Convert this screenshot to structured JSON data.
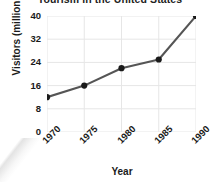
{
  "chart_data": {
    "type": "line",
    "title": "Tourism in the United States",
    "xlabel": "Year",
    "ylabel": "Visitors (millions)",
    "categories": [
      "1970",
      "1975",
      "1980",
      "1985",
      "1990"
    ],
    "x": [
      1970,
      1975,
      1980,
      1985,
      1990
    ],
    "values": [
      12,
      16,
      22,
      25,
      40
    ],
    "series": [
      {
        "name": "Visitors",
        "values": [
          12,
          16,
          22,
          25,
          40
        ]
      }
    ],
    "ylim": [
      0,
      40
    ],
    "yticks": [
      0,
      8,
      16,
      24,
      32,
      40
    ],
    "ytick_labels": [
      "0",
      "8",
      "16",
      "24",
      "32",
      "40"
    ],
    "xtick_labels": [
      "1970",
      "1975",
      "1980",
      "1985",
      "1990"
    ],
    "xtick_rotation": -45,
    "grid": true,
    "grid_axis": "both",
    "legend": false,
    "legend_position": "none",
    "marker": "circle",
    "colors": {
      "line": "#555555",
      "marker": "#1a1a1a",
      "grid": "#e6e6e6",
      "text": "#1a1a1a",
      "background": "#ffffff"
    }
  }
}
